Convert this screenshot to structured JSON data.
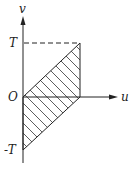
{
  "diagram": {
    "axes": {
      "horizontal_label": "u",
      "vertical_label": "v"
    },
    "tick_labels": {
      "top": "T",
      "origin": "O",
      "bottom": "-T"
    },
    "region": {
      "description": "hatched parallelogram",
      "vertices": [
        [
          "0",
          "0"
        ],
        [
          "T",
          "T"
        ],
        [
          "T",
          "0"
        ],
        [
          "0",
          "-T"
        ]
      ]
    },
    "colors": {
      "line": "#222222",
      "background": "#ffffff"
    }
  }
}
